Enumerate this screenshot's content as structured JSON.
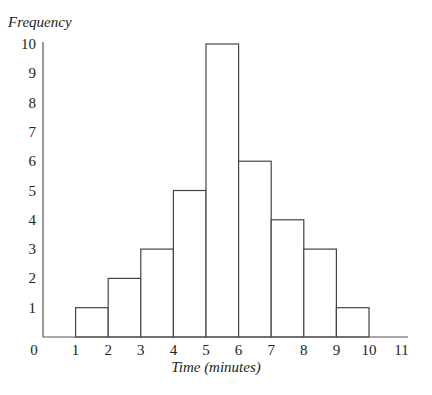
{
  "chart_data": {
    "type": "bar",
    "subtype": "histogram",
    "title": "",
    "xlabel": "Time (minutes)",
    "ylabel": "Frequency",
    "bins": [
      [
        1,
        2
      ],
      [
        2,
        3
      ],
      [
        3,
        4
      ],
      [
        4,
        5
      ],
      [
        5,
        6
      ],
      [
        6,
        7
      ],
      [
        7,
        8
      ],
      [
        8,
        9
      ],
      [
        9,
        10
      ]
    ],
    "categories": [
      "1-2",
      "2-3",
      "3-4",
      "4-5",
      "5-6",
      "6-7",
      "7-8",
      "8-9",
      "9-10"
    ],
    "values": [
      1,
      2,
      3,
      5,
      10,
      6,
      4,
      3,
      1
    ],
    "xlim": [
      0,
      11
    ],
    "ylim": [
      0,
      10
    ],
    "x_ticks": [
      "0",
      "1",
      "2",
      "3",
      "4",
      "5",
      "6",
      "7",
      "8",
      "9",
      "10",
      "11"
    ],
    "y_ticks": [
      "1",
      "2",
      "3",
      "4",
      "5",
      "6",
      "7",
      "8",
      "9",
      "10"
    ],
    "grid": false,
    "legend": null,
    "bar_fill": "#ffffff",
    "bar_stroke": "#444444"
  }
}
